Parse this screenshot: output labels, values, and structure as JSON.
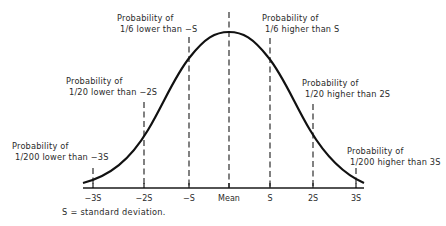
{
  "diagram": {
    "title": "",
    "type": "normal-distribution-curve",
    "axis": {
      "ticks": [
        {
          "label": "−3S",
          "x": 93
        },
        {
          "label": "−2S",
          "x": 144
        },
        {
          "label": "−S",
          "x": 189
        },
        {
          "label": "Mean",
          "x": 229
        },
        {
          "label": "S",
          "x": 270
        },
        {
          "label": "2S",
          "x": 313
        },
        {
          "label": "3S",
          "x": 356
        }
      ]
    },
    "annotations": [
      {
        "line1": "Probability of",
        "line2": "1/6 lower than −S"
      },
      {
        "line1": "Probability of",
        "line2": "1/20 lower than −2S"
      },
      {
        "line1": "Probability of",
        "line2": "1/200 lower than −3S"
      },
      {
        "line1": "Probability of",
        "line2": "1/6 higher than S"
      },
      {
        "line1": "Probability of",
        "line2": "1/20 higher than 2S"
      },
      {
        "line1": "Probability of",
        "line2": "1/200 higher than 3S"
      }
    ],
    "footnote": "S = standard deviation.",
    "colors": {
      "line": "#1a1a1a",
      "text": "#2a2a2a",
      "background": "#ffffff"
    }
  }
}
